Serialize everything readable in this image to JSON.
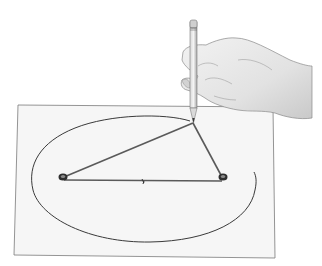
{
  "figure": {
    "elements": {
      "paper": "paper-sheet",
      "ellipse": "partially-drawn-ellipse",
      "focus_left": "pin-focus-1",
      "focus_right": "pin-focus-2",
      "string": "string-loop",
      "pencil": "pencil",
      "hand": "hand"
    },
    "colors": {
      "background": "#ffffff",
      "paper": "#f6f6f6",
      "paper_edge": "#7a7a7a",
      "line": "#3a3a3a",
      "string": "#5a5a5a",
      "skin": "#e4e4e4",
      "skin_shadow": "#b8b8b8"
    }
  }
}
